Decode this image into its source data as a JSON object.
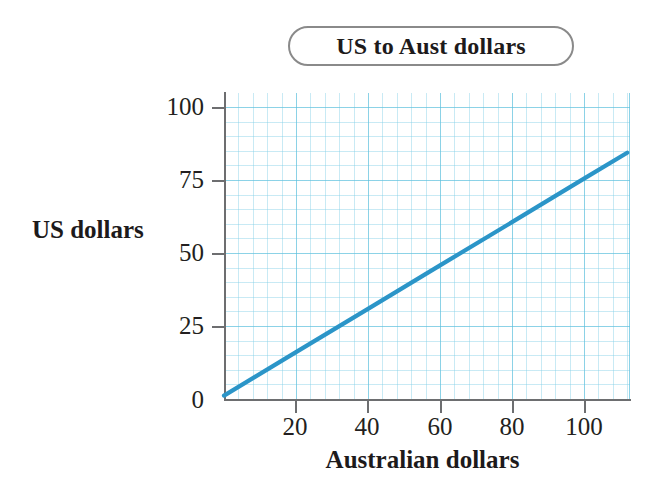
{
  "chart_data": {
    "type": "line",
    "title": "US to Aust dollars",
    "xlabel": "Australian dollars",
    "ylabel": "US dollars",
    "xlim": [
      0,
      112.5
    ],
    "ylim": [
      0,
      105
    ],
    "grid": true,
    "grid_major_x_step": 20,
    "grid_minor_x_step": 4,
    "grid_major_y_step": 25,
    "grid_minor_y_step": 5,
    "legend": "none",
    "line_color": "#2b95c8",
    "grid_color": "#7dcde6",
    "axis_color": "#6d6e70",
    "x_ticks": [
      0,
      20,
      40,
      60,
      80,
      100
    ],
    "x_tick_labels": [
      "0",
      "20",
      "40",
      "60",
      "80",
      "100"
    ],
    "y_ticks": [
      0,
      25,
      50,
      75,
      100
    ],
    "y_tick_labels": [
      "0",
      "25",
      "50",
      "75",
      "100"
    ],
    "series": [
      {
        "name": "US dollars per Australian dollar",
        "x": [
          0,
          20,
          40,
          60,
          80,
          100,
          112
        ],
        "y": [
          1.5,
          16.4,
          31.2,
          46.1,
          60.9,
          75.8,
          84.7
        ]
      }
    ],
    "annotations": []
  },
  "title_box": {
    "label": "US to Aust dollars"
  },
  "axes": {
    "y_title": "US dollars",
    "x_title": "Australian dollars",
    "y_tick_labels": [
      "100",
      "75",
      "50",
      "25",
      "0"
    ],
    "x_tick_labels": [
      "0",
      "20",
      "40",
      "60",
      "80",
      "100"
    ]
  }
}
